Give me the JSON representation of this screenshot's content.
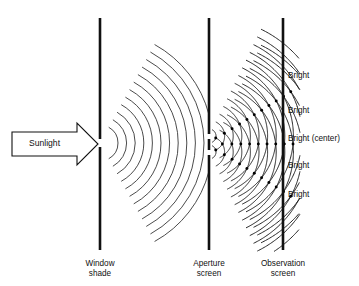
{
  "figure": {
    "background_color": "#ffffff",
    "line_color": "#111111",
    "wave_color": "#2b2b2b",
    "width": 359,
    "height": 286
  },
  "source": {
    "arrow_label": "Sunlight",
    "arrow": {
      "x_start": 12,
      "x_end": 98,
      "y_center": 144,
      "body_half_height": 12,
      "head_length": 21,
      "head_half_height": 21
    }
  },
  "screens": [
    {
      "id": "window-shade",
      "caption_line1": "Window",
      "caption_line2": "shade",
      "x": 100,
      "y_top": 18,
      "y_bottom": 250,
      "slits": [
        {
          "y_top": 139,
          "y_bottom": 147
        }
      ]
    },
    {
      "id": "aperture-screen",
      "caption_line1": "Aperture",
      "caption_line2": "screen",
      "x": 209,
      "y_top": 18,
      "y_bottom": 250,
      "slits": [
        {
          "y_top": 134,
          "y_bottom": 139
        },
        {
          "y_top": 150,
          "y_bottom": 155
        }
      ]
    },
    {
      "id": "observation-screen",
      "caption_line1": "Observation",
      "caption_line2": "screen",
      "x": 283,
      "y_top": 18,
      "y_bottom": 250,
      "slits": []
    }
  ],
  "wavefronts": {
    "single_slit": {
      "origin_x": 100,
      "origin_y": 143,
      "count": 12,
      "first_radius": 18,
      "spacing": 8.6,
      "angle_span_deg": 122
    },
    "double_slit": {
      "count": 14,
      "first_radius": 7,
      "spacing": 8.6,
      "angle_span_deg": 128,
      "sources": [
        {
          "origin_x": 209,
          "origin_y": 136
        },
        {
          "origin_x": 209,
          "origin_y": 152
        }
      ]
    }
  },
  "fringes": {
    "label_x": 288,
    "labels": [
      {
        "text": "Bright",
        "y": 76
      },
      {
        "text": "Bright",
        "y": 111
      },
      {
        "text": "Bright (center)",
        "y": 139
      },
      {
        "text": "Bright",
        "y": 166
      },
      {
        "text": "Bright",
        "y": 195
      }
    ]
  },
  "captions": {
    "baseline_y1": 266,
    "baseline_y2": 276
  }
}
